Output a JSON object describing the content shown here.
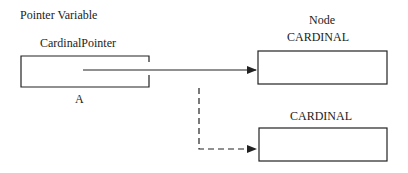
{
  "labels": {
    "pointer_variable": "Pointer Variable",
    "pointer_name": "CardinalPointer",
    "pointer_id": "A",
    "node_heading": "Node",
    "node1_type": "CARDINAL",
    "node2_type": "CARDINAL"
  },
  "colors": {
    "stroke": "#222222",
    "background": "#ffffff"
  }
}
